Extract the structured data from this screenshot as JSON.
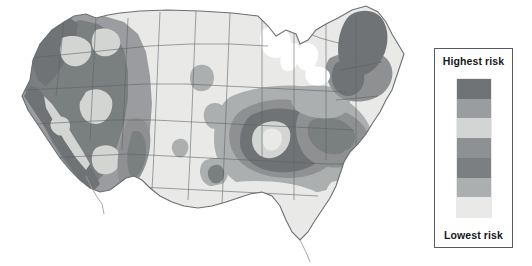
{
  "figure": {
    "kind": "choropleth-contour-map",
    "region": "Contiguous United States",
    "background_color": "#ffffff"
  },
  "legend": {
    "top_label": "Highest risk",
    "bottom_label": "Lowest risk",
    "border_color": "#555a5e",
    "background": "#ffffff",
    "orientation": "vertical",
    "band_count": 7,
    "bands": [
      {
        "rank": 7,
        "name": "highest-risk",
        "color": "#6f7376"
      },
      {
        "rank": 6,
        "name": "very-high-risk",
        "color": "#9a9d9f"
      },
      {
        "rank": 5,
        "name": "high-risk",
        "color": "#d3d5d4"
      },
      {
        "rank": 4,
        "name": "moderate-risk",
        "color": "#8e9193"
      },
      {
        "rank": 3,
        "name": "low-moderate-risk",
        "color": "#7b7f81"
      },
      {
        "rank": 2,
        "name": "low-risk",
        "color": "#acafaf"
      },
      {
        "rank": 1,
        "name": "lowest-risk",
        "color": "#e9eae8"
      }
    ]
  },
  "map": {
    "outline_color": "#6b6f72",
    "state_border_color": "#5d6165",
    "water_color": "#ffffff",
    "zones": [
      {
        "name": "pacific-northwest-coast",
        "risk_rank": 7
      },
      {
        "name": "california-san-andreas",
        "risk_rank": 7
      },
      {
        "name": "intermountain-west",
        "risk_rank": 6
      },
      {
        "name": "great-basin-nevada",
        "risk_rank": 6
      },
      {
        "name": "wasatch-utah",
        "risk_rank": 6
      },
      {
        "name": "rio-grande-rift",
        "risk_rank": 5
      },
      {
        "name": "great-plains",
        "risk_rank": 1
      },
      {
        "name": "texas-gulf-coast",
        "risk_rank": 1
      },
      {
        "name": "new-madrid-seismic-zone",
        "risk_rank": 7
      },
      {
        "name": "appalachian-belt",
        "risk_rank": 5
      },
      {
        "name": "charleston-south-carolina",
        "risk_rank": 6
      },
      {
        "name": "florida-peninsula",
        "risk_rank": 1
      },
      {
        "name": "new-england-northeast",
        "risk_rank": 7
      },
      {
        "name": "great-lakes-water",
        "risk_rank": 0
      }
    ]
  }
}
